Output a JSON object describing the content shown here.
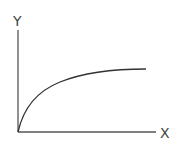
{
  "diagram": {
    "type": "saturation-curve",
    "x_axis_label": "X",
    "y_axis_label": "Y",
    "colors": {
      "axis": "#555555",
      "curve": "#333333",
      "label": "#444444",
      "background": "#ffffff"
    },
    "curve_description": "Monotonically increasing concave curve starting at origin, rising steeply and leveling off toward a plateau"
  }
}
